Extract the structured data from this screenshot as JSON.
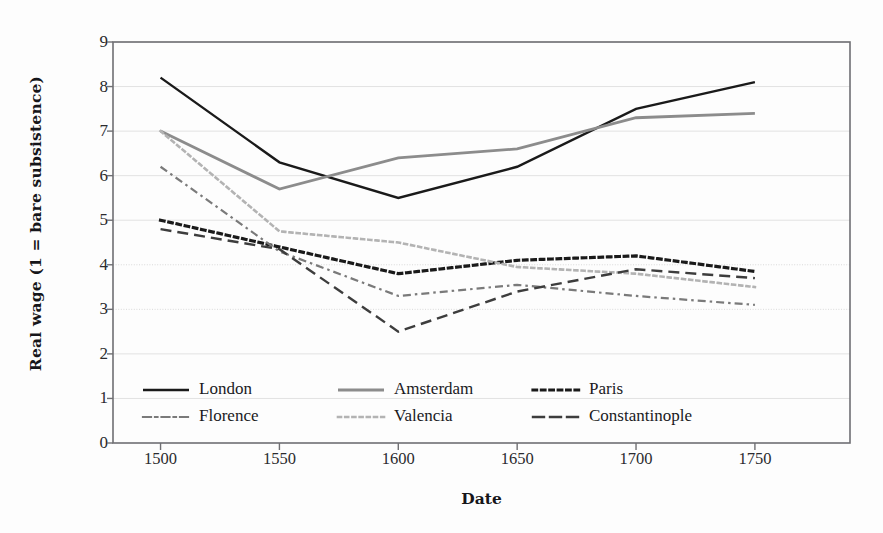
{
  "chart_data": {
    "type": "line",
    "title": "",
    "xlabel": "Date",
    "ylabel": "Real wage (1 = bare subsistence)",
    "x": [
      1500,
      1550,
      1600,
      1650,
      1700,
      1750
    ],
    "xtick_labels": [
      "1500",
      "1550",
      "1600",
      "1650",
      "1700",
      "1750"
    ],
    "ytick_labels": [
      "0",
      "1",
      "2",
      "3",
      "4",
      "5",
      "6",
      "7",
      "8",
      "9"
    ],
    "xlim": [
      1480,
      1790
    ],
    "ylim": [
      0,
      9
    ],
    "grid": "horizontal",
    "legend_position": "inside-bottom-left",
    "series": [
      {
        "name": "London",
        "values": [
          8.2,
          6.3,
          5.5,
          6.2,
          7.5,
          8.1
        ],
        "style": "solid",
        "color": "#1a1a1a",
        "width": 2.4
      },
      {
        "name": "Amsterdam",
        "values": [
          7.0,
          5.7,
          6.4,
          6.6,
          7.3,
          7.4
        ],
        "style": "solid",
        "color": "#8c8c8c",
        "width": 2.8
      },
      {
        "name": "Paris",
        "values": [
          5.0,
          4.4,
          3.8,
          4.1,
          4.2,
          3.85
        ],
        "style": "dotted",
        "color": "#1a1a1a",
        "width": 3.2
      },
      {
        "name": "Florence",
        "values": [
          6.2,
          4.3,
          3.3,
          3.55,
          3.3,
          3.1
        ],
        "style": "dashdot",
        "color": "#7a7a7a",
        "width": 2.2
      },
      {
        "name": "Valencia",
        "values": [
          7.0,
          4.75,
          4.5,
          3.95,
          3.8,
          3.5
        ],
        "style": "dotted",
        "color": "#b3b3b3",
        "width": 2.6
      },
      {
        "name": "Constantinople",
        "values": [
          4.8,
          4.35,
          2.5,
          3.4,
          3.9,
          3.7
        ],
        "style": "dashed",
        "color": "#3d3d3d",
        "width": 2.4
      }
    ]
  },
  "legend": {
    "entries": [
      {
        "label": "London"
      },
      {
        "label": "Amsterdam"
      },
      {
        "label": "Paris"
      },
      {
        "label": "Florence"
      },
      {
        "label": "Valencia"
      },
      {
        "label": "Constantinople"
      }
    ]
  },
  "axes": {
    "plot_left": 113,
    "plot_right": 850,
    "plot_top": 42,
    "plot_bottom": 443
  }
}
